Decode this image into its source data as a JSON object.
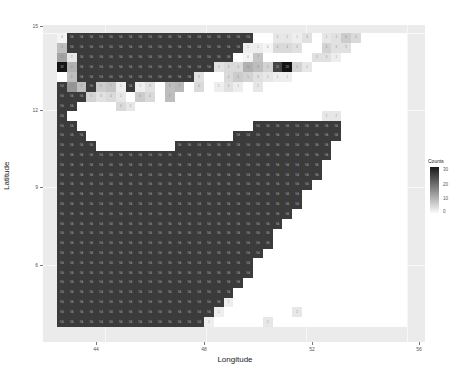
{
  "chart_data": {
    "type": "heatmap",
    "title": "",
    "xlabel": "Longitude",
    "ylabel": "Latitude",
    "x_ticks": [
      44,
      48,
      52,
      56
    ],
    "y_ticks": [
      6,
      9,
      12,
      15
    ],
    "xlim": [
      42.3,
      56.2
    ],
    "ylim": [
      4.2,
      15.2
    ],
    "legend": {
      "title": "Counts",
      "breaks": [
        0,
        10,
        20,
        30
      ],
      "low_color": "#ffffff",
      "high_color": "#1a1a1a",
      "position": "right"
    },
    "grid": {
      "origin_x_px": 57,
      "origin_y_px": 33,
      "cell_px": 9.8,
      "ncols": 36,
      "nrows": 30,
      "na_fill": "#3b3b3b",
      "na_label": "NA",
      "note": "rows listed top (north) to bottom (south); 'N' = NA dark cell, number = count, null = empty"
    },
    "rows": [
      [
        0,
        "N",
        "N",
        "N",
        "N",
        "N",
        "N",
        "N",
        "N",
        "N",
        "N",
        "N",
        "N",
        "N",
        "N",
        "N",
        "N",
        "N",
        "N",
        "N",
        null,
        null,
        2,
        2,
        1,
        3,
        null,
        2,
        3,
        6,
        4,
        null,
        null,
        null,
        null,
        null
      ],
      [
        8,
        "N",
        "N",
        "N",
        "N",
        "N",
        "N",
        "N",
        "N",
        "N",
        "N",
        "N",
        "N",
        "N",
        "N",
        "N",
        "N",
        "N",
        "N",
        1,
        1,
        0,
        4,
        4,
        3,
        null,
        null,
        5,
        3,
        3,
        null,
        null,
        null,
        null,
        null,
        null
      ],
      [
        12,
        2,
        "N",
        "N",
        "N",
        "N",
        "N",
        "N",
        "N",
        "N",
        "N",
        "N",
        "N",
        "N",
        "N",
        "N",
        "N",
        "N",
        null,
        0,
        7,
        null,
        null,
        null,
        null,
        null,
        3,
        3,
        1,
        null,
        null,
        null,
        null,
        null,
        null,
        null
      ],
      [
        33,
        10,
        "N",
        "N",
        "N",
        "N",
        "N",
        "N",
        "N",
        "N",
        "N",
        "N",
        "N",
        "N",
        "N",
        "N",
        3,
        4,
        4,
        10,
        8,
        5,
        26,
        33,
        5,
        2,
        null,
        null,
        null,
        null,
        null,
        null,
        null,
        null,
        null,
        null
      ],
      [
        null,
        8,
        "N",
        "N",
        "N",
        "N",
        "N",
        "N",
        "N",
        "N",
        "N",
        "N",
        "N",
        "N",
        3,
        null,
        null,
        4,
        6,
        5,
        3,
        2,
        1,
        1,
        null,
        null,
        null,
        null,
        null,
        null,
        null,
        null,
        null,
        null,
        null,
        null
      ],
      [
        "N",
        14,
        8,
        "N",
        6,
        7,
        1,
        "N",
        1,
        3,
        null,
        8,
        9,
        null,
        4,
        null,
        1,
        3,
        1,
        null,
        2,
        null,
        null,
        null,
        null,
        null,
        null,
        null,
        null,
        null,
        null,
        null,
        null,
        null,
        null,
        null
      ],
      [
        "N",
        "N",
        "N",
        5,
        3,
        4,
        2,
        null,
        6,
        4,
        null,
        8,
        null,
        null,
        null,
        null,
        null,
        null,
        null,
        null,
        null,
        null,
        null,
        null,
        null,
        null,
        null,
        null,
        null,
        null,
        null,
        null,
        null,
        null,
        null,
        null
      ],
      [
        "N",
        "N",
        null,
        null,
        null,
        null,
        4,
        2,
        null,
        null,
        null,
        null,
        null,
        null,
        null,
        null,
        null,
        null,
        null,
        null,
        null,
        null,
        null,
        null,
        null,
        null,
        null,
        null,
        null,
        null,
        null,
        null,
        null,
        null,
        null,
        null
      ],
      [
        "N",
        null,
        null,
        null,
        null,
        null,
        null,
        null,
        null,
        null,
        null,
        null,
        null,
        null,
        null,
        null,
        null,
        null,
        null,
        null,
        null,
        null,
        null,
        null,
        null,
        null,
        null,
        2,
        2,
        null,
        null,
        null,
        null,
        null,
        null,
        null
      ],
      [
        "N",
        "N",
        null,
        null,
        null,
        null,
        null,
        null,
        null,
        null,
        null,
        null,
        null,
        null,
        null,
        null,
        null,
        null,
        null,
        null,
        "N",
        "N",
        "N",
        "N",
        "N",
        "N",
        "N",
        "N",
        "N",
        null,
        null,
        null,
        null,
        null,
        null,
        null
      ],
      [
        "N",
        "N",
        "N",
        null,
        null,
        null,
        null,
        null,
        null,
        null,
        null,
        null,
        null,
        null,
        null,
        null,
        null,
        null,
        "N",
        "N",
        "N",
        "N",
        "N",
        "N",
        "N",
        "N",
        "N",
        "N",
        "N",
        null,
        null,
        null,
        null,
        null,
        null,
        null
      ],
      [
        "N",
        "N",
        "N",
        "N",
        null,
        null,
        null,
        null,
        null,
        null,
        null,
        null,
        "N",
        "N",
        "N",
        "N",
        "N",
        "N",
        "N",
        "N",
        "N",
        "N",
        "N",
        "N",
        "N",
        "N",
        "N",
        "N",
        null,
        null,
        null,
        null,
        null,
        null,
        null,
        null
      ],
      [
        "N",
        "N",
        "N",
        "N",
        "N",
        "N",
        "N",
        "N",
        "N",
        "N",
        "N",
        "N",
        "N",
        "N",
        "N",
        "N",
        "N",
        "N",
        "N",
        "N",
        "N",
        "N",
        "N",
        "N",
        "N",
        "N",
        "N",
        "N",
        null,
        null,
        null,
        null,
        null,
        null,
        null,
        null
      ],
      [
        "N",
        "N",
        "N",
        "N",
        "N",
        "N",
        "N",
        "N",
        "N",
        "N",
        "N",
        "N",
        "N",
        "N",
        "N",
        "N",
        "N",
        "N",
        "N",
        "N",
        "N",
        "N",
        "N",
        "N",
        "N",
        "N",
        "N",
        null,
        null,
        null,
        null,
        null,
        null,
        null,
        null,
        null
      ],
      [
        "N",
        "N",
        "N",
        "N",
        "N",
        "N",
        "N",
        "N",
        "N",
        "N",
        "N",
        "N",
        "N",
        "N",
        "N",
        "N",
        "N",
        "N",
        "N",
        "N",
        "N",
        "N",
        "N",
        "N",
        "N",
        "N",
        "N",
        null,
        null,
        null,
        null,
        null,
        null,
        null,
        null,
        null
      ],
      [
        "N",
        "N",
        "N",
        "N",
        "N",
        "N",
        "N",
        "N",
        "N",
        "N",
        "N",
        "N",
        "N",
        "N",
        "N",
        "N",
        "N",
        "N",
        "N",
        "N",
        "N",
        "N",
        "N",
        "N",
        "N",
        "N",
        null,
        null,
        null,
        null,
        null,
        null,
        null,
        null,
        null,
        null
      ],
      [
        "N",
        "N",
        "N",
        "N",
        "N",
        "N",
        "N",
        "N",
        "N",
        "N",
        "N",
        "N",
        "N",
        "N",
        "N",
        "N",
        "N",
        "N",
        "N",
        "N",
        "N",
        "N",
        "N",
        "N",
        "N",
        null,
        null,
        null,
        null,
        null,
        null,
        null,
        null,
        null,
        null,
        null
      ],
      [
        "N",
        "N",
        "N",
        "N",
        "N",
        "N",
        "N",
        "N",
        "N",
        "N",
        "N",
        "N",
        "N",
        "N",
        "N",
        "N",
        "N",
        "N",
        "N",
        "N",
        "N",
        "N",
        "N",
        "N",
        "N",
        null,
        null,
        null,
        null,
        null,
        null,
        null,
        null,
        null,
        null,
        null
      ],
      [
        "N",
        "N",
        "N",
        "N",
        "N",
        "N",
        "N",
        "N",
        "N",
        "N",
        "N",
        "N",
        "N",
        "N",
        "N",
        "N",
        "N",
        "N",
        "N",
        "N",
        "N",
        "N",
        "N",
        "N",
        null,
        null,
        null,
        null,
        null,
        null,
        null,
        null,
        null,
        null,
        null,
        null
      ],
      [
        "N",
        "N",
        "N",
        "N",
        "N",
        "N",
        "N",
        "N",
        "N",
        "N",
        "N",
        "N",
        "N",
        "N",
        "N",
        "N",
        "N",
        "N",
        "N",
        "N",
        "N",
        "N",
        "N",
        null,
        null,
        null,
        null,
        null,
        null,
        null,
        null,
        null,
        null,
        null,
        null,
        null
      ],
      [
        "N",
        "N",
        "N",
        "N",
        "N",
        "N",
        "N",
        "N",
        "N",
        "N",
        "N",
        "N",
        "N",
        "N",
        "N",
        "N",
        "N",
        "N",
        "N",
        "N",
        "N",
        "N",
        null,
        null,
        null,
        null,
        null,
        null,
        null,
        null,
        null,
        null,
        null,
        null,
        null,
        null
      ],
      [
        "N",
        "N",
        "N",
        "N",
        "N",
        "N",
        "N",
        "N",
        "N",
        "N",
        "N",
        "N",
        "N",
        "N",
        "N",
        "N",
        "N",
        "N",
        "N",
        "N",
        "N",
        "N",
        null,
        null,
        null,
        null,
        null,
        null,
        null,
        null,
        null,
        null,
        null,
        null,
        null,
        null
      ],
      [
        "N",
        "N",
        "N",
        "N",
        "N",
        "N",
        "N",
        "N",
        "N",
        "N",
        "N",
        "N",
        "N",
        "N",
        "N",
        "N",
        "N",
        "N",
        "N",
        "N",
        "N",
        null,
        null,
        null,
        null,
        null,
        null,
        null,
        null,
        null,
        null,
        null,
        null,
        null,
        null,
        null
      ],
      [
        "N",
        "N",
        "N",
        "N",
        "N",
        "N",
        "N",
        "N",
        "N",
        "N",
        "N",
        "N",
        "N",
        "N",
        "N",
        "N",
        "N",
        "N",
        "N",
        "N",
        null,
        null,
        null,
        null,
        null,
        null,
        null,
        null,
        null,
        null,
        null,
        null,
        null,
        null,
        null,
        null
      ],
      [
        "N",
        "N",
        "N",
        "N",
        "N",
        "N",
        "N",
        "N",
        "N",
        "N",
        "N",
        "N",
        "N",
        "N",
        "N",
        "N",
        "N",
        "N",
        "N",
        "N",
        null,
        null,
        null,
        null,
        null,
        null,
        null,
        null,
        null,
        null,
        null,
        null,
        null,
        null,
        null,
        null
      ],
      [
        "N",
        "N",
        "N",
        "N",
        "N",
        "N",
        "N",
        "N",
        "N",
        "N",
        "N",
        "N",
        "N",
        "N",
        "N",
        "N",
        "N",
        "N",
        "N",
        null,
        null,
        null,
        null,
        null,
        null,
        null,
        null,
        null,
        null,
        null,
        null,
        null,
        null,
        null,
        null,
        null
      ],
      [
        "N",
        "N",
        "N",
        "N",
        "N",
        "N",
        "N",
        "N",
        "N",
        "N",
        "N",
        "N",
        "N",
        "N",
        "N",
        "N",
        "N",
        "N",
        null,
        null,
        null,
        null,
        null,
        null,
        null,
        null,
        null,
        null,
        null,
        null,
        null,
        null,
        null,
        null,
        null,
        null
      ],
      [
        "N",
        "N",
        "N",
        "N",
        "N",
        "N",
        "N",
        "N",
        "N",
        "N",
        "N",
        "N",
        "N",
        "N",
        "N",
        "N",
        "N",
        1,
        null,
        null,
        null,
        null,
        null,
        null,
        null,
        null,
        null,
        null,
        null,
        null,
        null,
        null,
        null,
        null,
        null,
        null
      ],
      [
        "N",
        "N",
        "N",
        "N",
        "N",
        "N",
        "N",
        "N",
        "N",
        "N",
        "N",
        "N",
        "N",
        "N",
        "N",
        "N",
        1,
        null,
        null,
        null,
        null,
        null,
        null,
        null,
        2,
        null,
        null,
        null,
        null,
        null,
        null,
        null,
        null,
        null,
        null,
        null
      ],
      [
        "N",
        "N",
        "N",
        "N",
        "N",
        "N",
        "N",
        "N",
        "N",
        "N",
        "N",
        "N",
        "N",
        "N",
        "N",
        1,
        null,
        null,
        null,
        null,
        null,
        2,
        null,
        null,
        null,
        null,
        null,
        null,
        null,
        null,
        null,
        null,
        null,
        null,
        null,
        null
      ]
    ]
  },
  "axes": {
    "xlabel": "Longitude",
    "ylabel": "Latitude",
    "x_ticks": [
      "44",
      "48",
      "52",
      "56"
    ],
    "y_ticks": [
      "6",
      "9",
      "12",
      "15"
    ]
  },
  "legend": {
    "title": "Counts",
    "labels": [
      "30",
      "20",
      "10",
      "0"
    ]
  }
}
